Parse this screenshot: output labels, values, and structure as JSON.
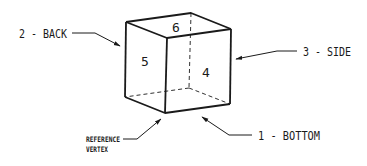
{
  "diagram": {
    "colors": {
      "line": "#1a1a1a",
      "background": "#ffffff"
    },
    "faces": [
      {
        "id": "top",
        "number": "6"
      },
      {
        "id": "back-left",
        "number": "5"
      },
      {
        "id": "front-right",
        "number": "4"
      }
    ],
    "callouts": [
      {
        "id": "bottom",
        "label": "1 - BOTTOM"
      },
      {
        "id": "back",
        "label": "2 - BACK"
      },
      {
        "id": "side",
        "label": "3 - SIDE"
      },
      {
        "id": "reference-vertex",
        "line1": "REFERENCE",
        "line2": "VERTEX"
      }
    ]
  }
}
